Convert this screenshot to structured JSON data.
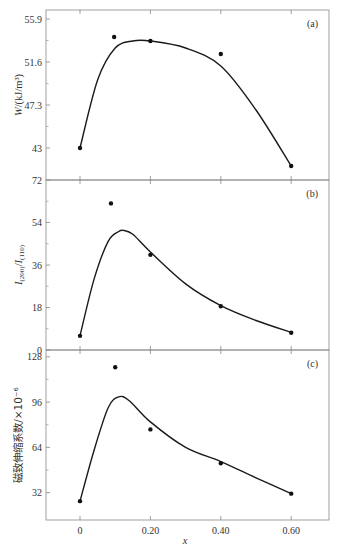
{
  "chart_data": [
    {
      "id": "a",
      "type": "scatter",
      "panel_label": "(a)",
      "title": "",
      "xlabel": "",
      "ylabel": "W/(kJ/m³)",
      "ylabel_italic_part": "W",
      "ylabel_rest": "/(kJ/m³)",
      "yticks": [
        43,
        47.3,
        51.6,
        55.9
      ],
      "ytick_labels": [
        "43",
        "47.3",
        "51.6",
        "55.9"
      ],
      "ylim": [
        39.8,
        56.8
      ],
      "xlim": [
        -0.097,
        0.705
      ],
      "points": {
        "x": [
          0,
          0.097,
          0.2,
          0.4,
          0.6
        ],
        "y": [
          43.0,
          54.1,
          53.7,
          52.4,
          41.2
        ]
      },
      "fit_curve": {
        "x": [
          0,
          0.05,
          0.1,
          0.15,
          0.2,
          0.3,
          0.4,
          0.5,
          0.6
        ],
        "y": [
          43.0,
          49.8,
          53.0,
          53.7,
          53.7,
          53.0,
          51.2,
          46.8,
          41.2
        ]
      },
      "grid": false
    },
    {
      "id": "b",
      "type": "scatter",
      "panel_label": "(b)",
      "title": "",
      "xlabel": "",
      "ylabel": "I(200)/I(110)",
      "yticks": [
        0,
        18,
        36,
        54,
        72
      ],
      "ytick_labels": [
        "0",
        "18",
        "36",
        "54",
        "72"
      ],
      "ylim": [
        0,
        72
      ],
      "xlim": [
        -0.097,
        0.705
      ],
      "points": {
        "x": [
          0,
          0.088,
          0.2,
          0.4,
          0.6
        ],
        "y": [
          6.0,
          62.1,
          40.3,
          18.5,
          7.3
        ]
      },
      "fit_curve": {
        "x": [
          0,
          0.04,
          0.08,
          0.11,
          0.125,
          0.15,
          0.2,
          0.3,
          0.4,
          0.5,
          0.6
        ],
        "y": [
          6.0,
          30.0,
          46.0,
          50.2,
          50.6,
          49.0,
          41.5,
          28.0,
          18.8,
          12.5,
          7.5
        ]
      },
      "grid": false
    },
    {
      "id": "c",
      "type": "scatter",
      "panel_label": "(c)",
      "title": "",
      "xlabel": "x",
      "ylabel": "磁致伸缩系数/×10⁻⁶",
      "yticks": [
        32,
        64,
        96,
        128
      ],
      "ytick_labels": [
        "32",
        "64",
        "96",
        "128"
      ],
      "ylim": [
        12.7,
        132.8
      ],
      "xlim": [
        -0.097,
        0.705
      ],
      "xticks": [
        0,
        0.2,
        0.4,
        0.6
      ],
      "xtick_labels": [
        "0",
        "0.20",
        "0.40",
        "0.60"
      ],
      "points": {
        "x": [
          0,
          0.1,
          0.2,
          0.4,
          0.6
        ],
        "y": [
          26.0,
          120.6,
          76.7,
          52.8,
          31.3
        ]
      },
      "fit_curve": {
        "x": [
          0,
          0.04,
          0.08,
          0.11,
          0.14,
          0.2,
          0.3,
          0.4,
          0.5,
          0.6
        ],
        "y": [
          26.0,
          62.0,
          92.0,
          99.7,
          97.0,
          82.0,
          64.0,
          54.0,
          42.5,
          31.3
        ]
      },
      "grid": false
    }
  ],
  "figure": {
    "xlabel": "x",
    "colors": {
      "axes": "#888888",
      "line": "#1a1a1a",
      "point": "#111111",
      "text": "#333333"
    }
  }
}
